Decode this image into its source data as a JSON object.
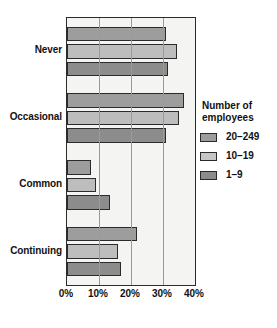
{
  "chart_data": {
    "type": "bar",
    "orientation": "horizontal",
    "title": "",
    "xlabel": "",
    "ylabel": "",
    "xlim": [
      0,
      40
    ],
    "xticks": [
      "0%",
      "10%",
      "20%",
      "30%",
      "40%"
    ],
    "xtick_values": [
      0,
      10,
      20,
      30,
      40
    ],
    "grid": true,
    "legend_position": "right",
    "categories": [
      "Never",
      "Occasional",
      "Common",
      "Continuing"
    ],
    "series": [
      {
        "name": "20–249",
        "color": "#9d9d9d",
        "values": [
          31,
          36.5,
          7.5,
          22
        ]
      },
      {
        "name": "10–19",
        "color": "#c6c6c6",
        "values": [
          34.5,
          35,
          9,
          16
        ]
      },
      {
        "name": "1–9",
        "color": "#8c8c8c",
        "values": [
          31.5,
          31,
          13.5,
          17
        ]
      }
    ]
  },
  "legend": {
    "title_line1": "Number of",
    "title_line2": "employees",
    "entries": [
      {
        "label": "20–249"
      },
      {
        "label": "10–19"
      },
      {
        "label": "1–9"
      }
    ]
  },
  "colors": {
    "series_20_249": "#9d9d9d",
    "series_10_19": "#c6c6c6",
    "series_1_9": "#8c8c8c",
    "plot_background": "#f4f4f2",
    "axis": "#2b2b2b",
    "gridline": "#9a9a9a",
    "page_background": "#ffffff"
  }
}
